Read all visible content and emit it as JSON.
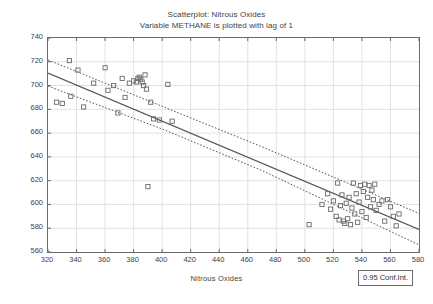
{
  "chart_data": {
    "type": "scatter",
    "title": "Scatterplot: Nitrous Oxides",
    "subtitle": "Variable METHANE is plotted with lag of 1",
    "xlabel": "Nitrous Oxides",
    "ylabel": "METHANE",
    "xlim": [
      320,
      580
    ],
    "ylim": [
      560,
      740
    ],
    "xticks": [
      320,
      340,
      360,
      380,
      400,
      420,
      440,
      460,
      480,
      500,
      520,
      540,
      560,
      580
    ],
    "yticks": [
      560,
      580,
      600,
      620,
      640,
      660,
      680,
      700,
      720,
      740
    ],
    "grid": true,
    "legend_position": "bottom-right",
    "legend_label": "0.95 Conf.Int.",
    "marker": "open-square",
    "marker_color": "#6a6a6a",
    "fit_line_color": "#555555",
    "conf_band_style": "dotted",
    "fit_line": {
      "x": [
        320,
        580
      ],
      "y": [
        710.5,
        579.0
      ]
    },
    "conf_upper": {
      "x": [
        320,
        400,
        470,
        580
      ],
      "y": [
        721.5,
        682.5,
        648.5,
        592.5
      ]
    },
    "conf_lower": {
      "x": [
        320,
        400,
        470,
        580
      ],
      "y": [
        699.5,
        663.5,
        628.5,
        566.0
      ]
    },
    "points": [
      [
        326,
        686
      ],
      [
        330,
        685
      ],
      [
        335,
        721
      ],
      [
        336,
        691
      ],
      [
        341,
        713
      ],
      [
        345,
        682
      ],
      [
        352,
        702
      ],
      [
        360,
        715
      ],
      [
        362,
        696
      ],
      [
        366,
        700
      ],
      [
        369,
        677
      ],
      [
        372,
        706
      ],
      [
        374,
        690
      ],
      [
        377,
        702
      ],
      [
        380,
        704
      ],
      [
        382,
        703
      ],
      [
        383,
        706
      ],
      [
        384,
        707
      ],
      [
        385,
        705
      ],
      [
        386,
        703
      ],
      [
        387,
        700
      ],
      [
        388,
        709
      ],
      [
        389,
        697
      ],
      [
        390,
        615
      ],
      [
        392,
        686
      ],
      [
        394,
        672
      ],
      [
        398,
        671
      ],
      [
        404,
        701
      ],
      [
        407,
        670
      ],
      [
        503,
        583
      ],
      [
        512,
        600
      ],
      [
        516,
        609
      ],
      [
        518,
        596
      ],
      [
        520,
        603
      ],
      [
        522,
        590
      ],
      [
        523,
        618
      ],
      [
        524,
        587
      ],
      [
        525,
        599
      ],
      [
        526,
        608
      ],
      [
        527,
        586
      ],
      [
        528,
        584
      ],
      [
        529,
        601
      ],
      [
        530,
        588
      ],
      [
        531,
        606
      ],
      [
        532,
        583
      ],
      [
        533,
        597
      ],
      [
        534,
        618
      ],
      [
        535,
        592
      ],
      [
        536,
        609
      ],
      [
        537,
        585
      ],
      [
        538,
        602
      ],
      [
        539,
        616
      ],
      [
        540,
        594
      ],
      [
        541,
        611
      ],
      [
        542,
        617
      ],
      [
        543,
        589
      ],
      [
        544,
        606
      ],
      [
        545,
        616
      ],
      [
        546,
        598
      ],
      [
        547,
        612
      ],
      [
        548,
        604
      ],
      [
        549,
        617
      ],
      [
        550,
        595
      ],
      [
        552,
        600
      ],
      [
        554,
        603
      ],
      [
        556,
        586
      ],
      [
        558,
        604
      ],
      [
        560,
        598
      ],
      [
        562,
        590
      ],
      [
        564,
        582
      ],
      [
        566,
        592
      ]
    ]
  }
}
